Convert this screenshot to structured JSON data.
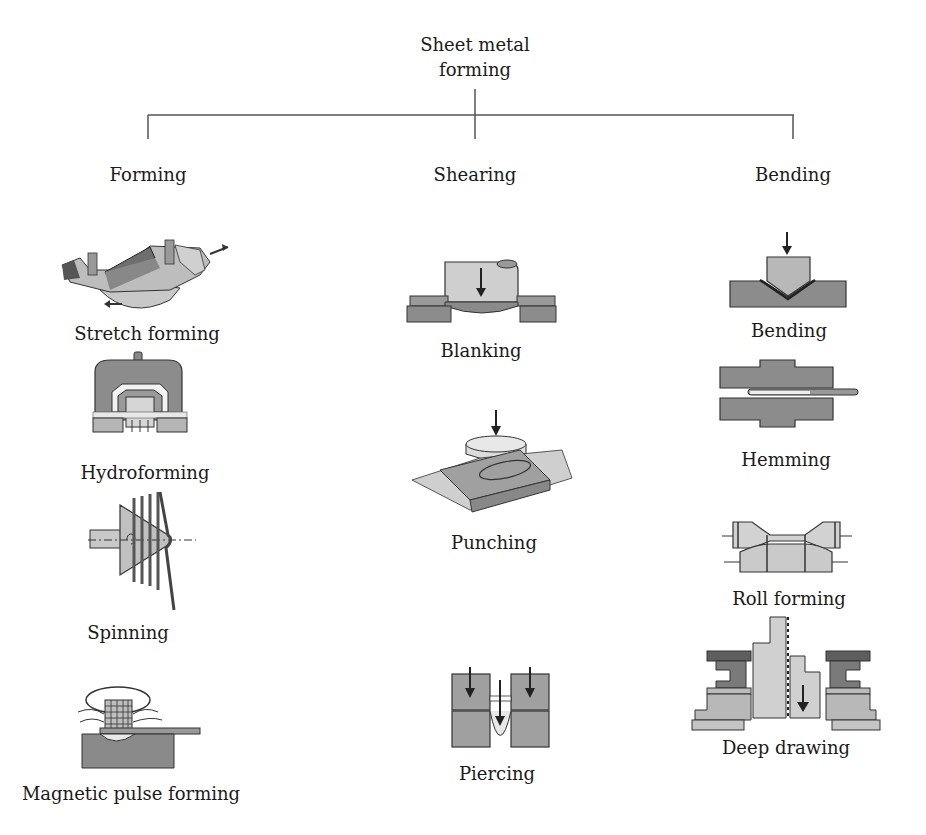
{
  "root": {
    "line1": "Sheet metal",
    "line2": "forming"
  },
  "categories": [
    {
      "id": "forming",
      "label": "Forming",
      "items": [
        "Stretch forming",
        "Hydroforming",
        "Spinning",
        "Magnetic pulse forming"
      ]
    },
    {
      "id": "shearing",
      "label": "Shearing",
      "items": [
        "Blanking",
        "Punching",
        "Piercing"
      ]
    },
    {
      "id": "bending",
      "label": "Bending",
      "items": [
        "Bending",
        "Hemming",
        "Roll forming",
        "Deep drawing"
      ]
    }
  ],
  "colors": {
    "line": "#555555",
    "dark_fill": "#7a7a7a",
    "mid_fill": "#a8a8a8",
    "light_fill": "#d6d6d6",
    "outline": "#2a2a2a"
  }
}
